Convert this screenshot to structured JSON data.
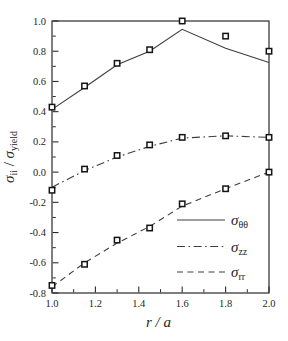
{
  "figure": {
    "background": "#ffffff",
    "axis_color": "#2b2b2b",
    "line_color": "#3e3e3e",
    "marker_stroke": "#141414",
    "marker_fill": "#ffffff",
    "text_color": "#262626"
  },
  "chart_data": {
    "type": "line",
    "title": "",
    "xlabel_parts": [
      {
        "t": "r / a",
        "italic": true
      }
    ],
    "ylabel_parts": [
      {
        "t": "σ",
        "italic": true
      },
      {
        "t": "ii",
        "sub": true
      },
      {
        "t": " / ",
        "italic": false
      },
      {
        "t": "σ",
        "italic": true
      },
      {
        "t": "yield",
        "sub": true
      }
    ],
    "xlim": [
      1.0,
      2.0
    ],
    "ylim": [
      -0.8,
      1.0
    ],
    "grid": false,
    "x_major_ticks": [
      {
        "v": 1.0,
        "label": "1.0"
      },
      {
        "v": 1.2,
        "label": "1.2"
      },
      {
        "v": 1.4,
        "label": "1.4"
      },
      {
        "v": 1.6,
        "label": "1.6"
      },
      {
        "v": 1.8,
        "label": "1.8"
      },
      {
        "v": 2.0,
        "label": "2.0"
      }
    ],
    "x_minor_ticks": [
      1.1,
      1.3,
      1.5,
      1.7,
      1.9
    ],
    "y_major_ticks": [
      {
        "v": 1.0,
        "label": "1.0"
      },
      {
        "v": 0.8,
        "label": "0.8"
      },
      {
        "v": 0.6,
        "label": "0.6"
      },
      {
        "v": 0.4,
        "label": "0.4"
      },
      {
        "v": 0.2,
        "label": "0.2"
      },
      {
        "v": 0.0,
        "label": "0.0"
      },
      {
        "v": -0.2,
        "label": "-0.2"
      },
      {
        "v": -0.4,
        "label": "-0.4"
      },
      {
        "v": -0.6,
        "label": "-0.6"
      },
      {
        "v": -0.8,
        "label": "-0.8"
      }
    ],
    "y_minor_ticks": [
      0.9,
      0.7,
      0.5,
      0.3,
      0.1,
      -0.1,
      -0.3,
      -0.5,
      -0.7
    ],
    "x": [
      1.0,
      1.15,
      1.3,
      1.45,
      1.6,
      1.8,
      2.0
    ],
    "series": [
      {
        "id": "sigma-theta-theta",
        "label_parts": [
          {
            "t": "σ",
            "italic": true
          },
          {
            "t": "θθ",
            "sub": true
          }
        ],
        "line_style": "solid",
        "markers": [
          0.43,
          0.57,
          0.72,
          0.81,
          1.0,
          0.9,
          0.8
        ],
        "line": [
          0.415,
          0.56,
          0.71,
          0.8,
          0.945,
          0.82,
          0.725
        ]
      },
      {
        "id": "sigma-zz",
        "label_parts": [
          {
            "t": "σ",
            "italic": true
          },
          {
            "t": "zz",
            "sub": true
          }
        ],
        "line_style": "dashdot",
        "markers": [
          -0.12,
          0.02,
          0.11,
          0.18,
          0.23,
          0.24,
          0.23
        ],
        "line": [
          -0.1,
          0.01,
          0.1,
          0.17,
          0.225,
          0.24,
          0.23
        ]
      },
      {
        "id": "sigma-rr",
        "label_parts": [
          {
            "t": "σ",
            "italic": true
          },
          {
            "t": "rr",
            "sub": true
          }
        ],
        "line_style": "dashed",
        "markers": [
          -0.75,
          -0.61,
          -0.45,
          -0.37,
          -0.21,
          -0.11,
          0.0
        ],
        "line": [
          -0.76,
          -0.6,
          -0.47,
          -0.36,
          -0.225,
          -0.11,
          0.0
        ]
      }
    ],
    "legend": {
      "position": "lower right"
    }
  }
}
